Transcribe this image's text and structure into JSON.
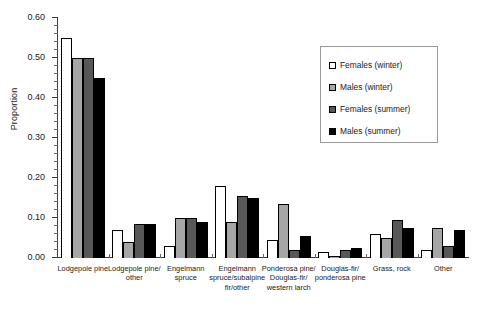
{
  "chart_data": {
    "type": "bar",
    "title": "",
    "subtitle": "",
    "xlabel": "",
    "ylabel": "Proportion",
    "ylim": [
      0.0,
      0.6
    ],
    "ytick_step": 0.1,
    "yminor_step": 0.02,
    "ytick_labels": [
      "0.00",
      "0.10",
      "0.20",
      "0.30",
      "0.40",
      "0.50",
      "0.60"
    ],
    "ytick_values": [
      0.0,
      0.1,
      0.2,
      0.3,
      0.4,
      0.5,
      0.6
    ],
    "grid": false,
    "legend_position": "upper right",
    "categories": [
      "Lodgepole pine",
      "Lodgepole pine/\nother",
      "Engelmann\nspruce",
      "Engelmann\nspruce/subalpine\nfir/other",
      "Ponderosa pine/\nDouglas-fir/\nwestern larch",
      "Douglas-fir/\nponderosa pine",
      "Grass, rock",
      "Other"
    ],
    "series": [
      {
        "name": "Females (winter)",
        "color": "#ffffff",
        "values": [
          0.55,
          0.07,
          0.03,
          0.18,
          0.045,
          0.015,
          0.06,
          0.02
        ]
      },
      {
        "name": "Males (winter)",
        "color": "#a6a6a6",
        "values": [
          0.5,
          0.04,
          0.1,
          0.09,
          0.135,
          0.005,
          0.05,
          0.075
        ]
      },
      {
        "name": "Females (summer)",
        "color": "#585858",
        "values": [
          0.5,
          0.085,
          0.1,
          0.155,
          0.02,
          0.02,
          0.095,
          0.03
        ]
      },
      {
        "name": "Males (summer)",
        "color": "#000000",
        "values": [
          0.45,
          0.085,
          0.09,
          0.15,
          0.055,
          0.025,
          0.075,
          0.07
        ]
      }
    ]
  },
  "legend": {
    "items": [
      {
        "label": "Females (winter)"
      },
      {
        "label": "Males (winter)"
      },
      {
        "label": "Females (summer)"
      },
      {
        "label": "Males (summer)"
      }
    ]
  }
}
